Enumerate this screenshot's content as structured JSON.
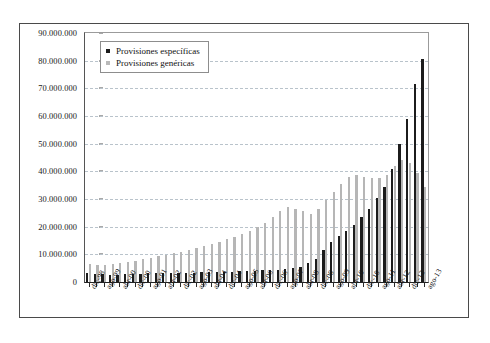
{
  "chart_data": {
    "type": "bar",
    "title": "",
    "xlabel": "",
    "ylabel": "",
    "ylim": [
      0,
      90000000
    ],
    "ytick_step": 10000000,
    "grid": true,
    "legend_position": "top-left",
    "ytick_labels": [
      "90.000.000",
      "80.000.000",
      "70.000.000",
      "60.000.000",
      "50.000.000",
      "40.000.000",
      "30.000.000",
      "20.000.000",
      "10.000.000",
      "0"
    ],
    "ytick_values": [
      90000000,
      80000000,
      70000000,
      60000000,
      50000000,
      40000000,
      30000000,
      20000000,
      10000000,
      0
    ],
    "categories": [
      "dic-98",
      "abr-99",
      "ago-99",
      "dic-99",
      "abr-00",
      "ago-00",
      "dic-00",
      "abr-01",
      "ago-01",
      "dic-01",
      "abr-02",
      "ago-02",
      "dic-02",
      "abr-03",
      "ago-03",
      "dic-03",
      "abr-04",
      "ago-04",
      "dic-04",
      "abr-05",
      "ago-05",
      "dic-05",
      "abr-06",
      "ago-06",
      "dic-06",
      "abr-07",
      "ago-07",
      "dic-07",
      "abr-08",
      "ago-08",
      "dic-08",
      "abr-09",
      "ago-09",
      "dic-09",
      "abr-10",
      "ago-10",
      "dic-10",
      "abr-11",
      "ago-11",
      "dic-11",
      "abr-12",
      "ago-12",
      "dic-12",
      "abr-13",
      "ago-13"
    ],
    "visible_tick_labels": [
      "dic-98",
      "ago-99",
      "abr-00",
      "dic-00",
      "ago-01",
      "abr-02",
      "dic-02",
      "ago-03",
      "abr-04",
      "dic-04",
      "ago-05",
      "abr-06",
      "dic-06",
      "ago-07",
      "abr-08",
      "dic-08",
      "ago-09",
      "abr-10",
      "dic-10",
      "ago-11",
      "abr-12",
      "dic-12",
      "ago-13"
    ],
    "series": [
      {
        "name": "Provisiones específicas",
        "color": "#1c1c1c",
        "values": [
          3200000,
          2900000,
          2800000,
          2700000,
          2700000,
          2800000,
          2900000,
          3000000,
          3100000,
          3200000,
          3200000,
          3300000,
          3300000,
          3400000,
          3400000,
          3500000,
          3500000,
          3600000,
          3700000,
          3800000,
          3900000,
          4000000,
          4100000,
          4200000,
          4300000,
          4500000,
          4700000,
          5000000,
          5600000,
          6800000,
          8300000,
          11500000,
          14500000,
          16500000,
          18500000,
          20500000,
          23500000,
          26500000,
          30500000,
          34500000,
          41000000,
          50000000,
          59000000,
          71500000,
          80500000
        ]
      },
      {
        "name": "Provisiones genéricas",
        "color": "#b6b6b6",
        "values": [
          6500000,
          6000000,
          6200000,
          6500000,
          6800000,
          7200000,
          7600000,
          8200000,
          8800000,
          9300000,
          9800000,
          10400000,
          11000000,
          11600000,
          12300000,
          13000000,
          13800000,
          14600000,
          15400000,
          16200000,
          17200000,
          18500000,
          19800000,
          21500000,
          23500000,
          25500000,
          27000000,
          26500000,
          25500000,
          24500000,
          26500000,
          29500000,
          32500000,
          35500000,
          38000000,
          38500000,
          38000000,
          37500000,
          37500000,
          38500000,
          42000000,
          44000000,
          43000000,
          39500000,
          34500000
        ]
      }
    ]
  },
  "legend": {
    "items": [
      {
        "label": "Provisiones específicas",
        "color": "#1c1c1c"
      },
      {
        "label": "Provisiones genéricas",
        "color": "#b9b9b9"
      }
    ]
  },
  "caption": ""
}
